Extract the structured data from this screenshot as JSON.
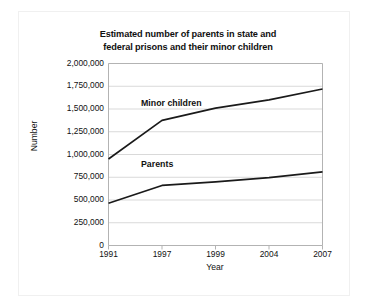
{
  "chart_data": {
    "type": "line",
    "title": "Estimated number of parents in state and federal prisons and their minor children",
    "title_lines": [
      "Estimated number of parents in state and",
      "federal prisons and their minor children"
    ],
    "xlabel": "Year",
    "ylabel": "Number",
    "categories": [
      "1991",
      "1997",
      "1999",
      "2004",
      "2007"
    ],
    "ylim": [
      0,
      2000000
    ],
    "ytick_values": [
      0,
      250000,
      500000,
      750000,
      1000000,
      1250000,
      1500000,
      1750000,
      2000000
    ],
    "ytick_labels": [
      "0",
      "250,000",
      "500,000",
      "750,000",
      "1,000,000",
      "1,250,000",
      "1,500,000",
      "1,750,000",
      "2,000,000"
    ],
    "grid": "horizontal",
    "legend_position": "inline-labels",
    "line_color": "#1a1a1a",
    "grid_color": "#d9d9d9",
    "axis_color": "#b3b3b3",
    "series": [
      {
        "name": "Minor children",
        "values": [
          950000,
          1375000,
          1510000,
          1600000,
          1720000
        ],
        "label_x_category": "1997",
        "label_value": 1560000
      },
      {
        "name": "Parents",
        "values": [
          465000,
          660000,
          700000,
          745000,
          810000
        ],
        "label_x_category": "1997",
        "label_value": 880000
      }
    ]
  }
}
